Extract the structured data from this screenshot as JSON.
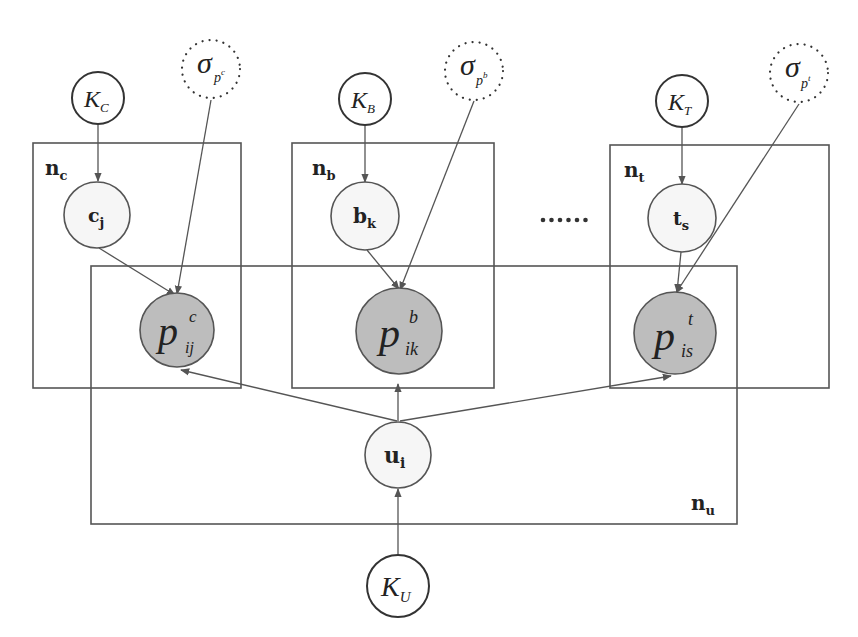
{
  "diagram": {
    "type": "probabilistic graphical model (plate notation)",
    "plates": [
      {
        "id": "nc",
        "label_main": "n",
        "label_sub": "c"
      },
      {
        "id": "nb",
        "label_main": "n",
        "label_sub": "b"
      },
      {
        "id": "nt",
        "label_main": "n",
        "label_sub": "t"
      },
      {
        "id": "nu",
        "label_main": "n",
        "label_sub": "u"
      }
    ],
    "nodes": {
      "K_C": {
        "main": "K",
        "sub": "C",
        "kind": "hyperparameter"
      },
      "K_B": {
        "main": "K",
        "sub": "B",
        "kind": "hyperparameter"
      },
      "K_T": {
        "main": "K",
        "sub": "T",
        "kind": "hyperparameter"
      },
      "K_U": {
        "main": "K",
        "sub": "U",
        "kind": "hyperparameter"
      },
      "sigma_pc": {
        "main": "σ",
        "sub": "p",
        "supsub": "c",
        "kind": "fixed"
      },
      "sigma_pb": {
        "main": "σ",
        "sub": "p",
        "supsub": "b",
        "kind": "fixed"
      },
      "sigma_pt": {
        "main": "σ",
        "sub": "p",
        "supsub": "t",
        "kind": "fixed"
      },
      "c_j": {
        "main": "c",
        "sub": "j",
        "kind": "latent"
      },
      "b_k": {
        "main": "b",
        "sub": "k",
        "kind": "latent"
      },
      "t_s": {
        "main": "t",
        "sub": "s",
        "kind": "latent"
      },
      "u_i": {
        "main": "u",
        "sub": "i",
        "kind": "latent"
      },
      "p_c": {
        "main": "p",
        "sup": "c",
        "sub": "ij",
        "kind": "observed"
      },
      "p_b": {
        "main": "p",
        "sup": "b",
        "sub": "ik",
        "kind": "observed"
      },
      "p_t": {
        "main": "p",
        "sup": "t",
        "sub": "is",
        "kind": "observed"
      }
    },
    "edges": [
      [
        "K_C",
        "c_j"
      ],
      [
        "K_B",
        "b_k"
      ],
      [
        "K_T",
        "t_s"
      ],
      [
        "K_U",
        "u_i"
      ],
      [
        "c_j",
        "p_c"
      ],
      [
        "b_k",
        "p_b"
      ],
      [
        "t_s",
        "p_t"
      ],
      [
        "sigma_pc",
        "p_c"
      ],
      [
        "sigma_pb",
        "p_b"
      ],
      [
        "sigma_pt",
        "p_t"
      ],
      [
        "u_i",
        "p_c"
      ],
      [
        "u_i",
        "p_b"
      ],
      [
        "u_i",
        "p_t"
      ]
    ],
    "ellipsis": "......",
    "colors": {
      "observed_fill": "#bdbdbd",
      "latent_fill": "#f6f6f6",
      "stroke": "#555555"
    }
  }
}
